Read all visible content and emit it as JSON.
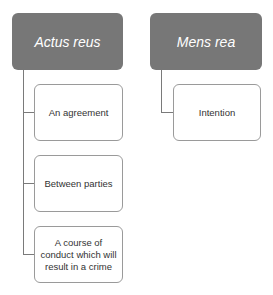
{
  "diagram": {
    "type": "hierarchy",
    "colors": {
      "parent_fill": "#777777",
      "parent_text": "#ffffff",
      "child_border": "#9a9a9a",
      "connector": "#7a7a7a"
    },
    "nodes": [
      {
        "label": "Actus reus",
        "children": [
          {
            "label": "An agreement"
          },
          {
            "label": "Between parties"
          },
          {
            "label": "A course of conduct which will result in a crime"
          }
        ]
      },
      {
        "label": "Mens rea",
        "children": [
          {
            "label": "Intention"
          }
        ]
      }
    ]
  }
}
